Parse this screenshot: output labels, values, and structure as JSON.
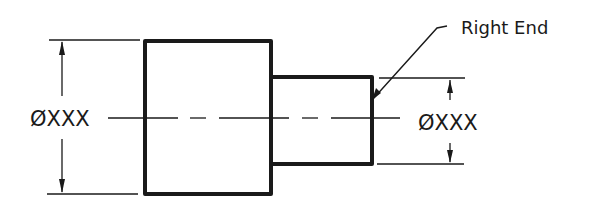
{
  "diagram": {
    "type": "engineering-drawing",
    "colors": {
      "ink": "#1a1a1a",
      "background": "#ffffff"
    },
    "labels": {
      "left_diameter": "ØXXX",
      "right_diameter": "ØXXX",
      "leader_note": "Right End"
    },
    "parts": {
      "large_cylinder": {
        "x1": 145,
        "y1": 41,
        "x2": 271,
        "y2": 194
      },
      "small_cylinder": {
        "x1": 271,
        "y1": 77,
        "x2": 372,
        "y2": 164
      }
    },
    "centerline_y": 118
  }
}
